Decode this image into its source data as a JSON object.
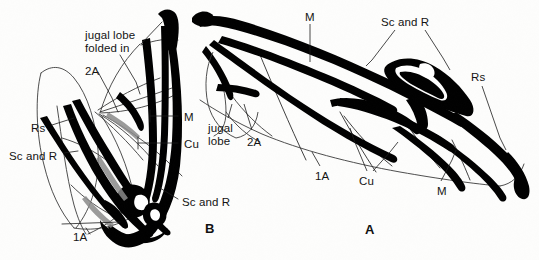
{
  "figure": {
    "background_color": "#fdfdfc",
    "ink_color": "#000000",
    "thin_line_color": "#2a2a2a"
  },
  "panels": [
    {
      "id": "panel-a",
      "letter": "A",
      "x": 365,
      "y": 222,
      "description": "hindwing spread out, jugal lobe expanded"
    },
    {
      "id": "panel-b",
      "letter": "B",
      "x": 205,
      "y": 221,
      "description": "hindwing folded, jugal lobe folded in"
    }
  ],
  "labels": [
    {
      "id": "b-jugal-lobe-folded-in",
      "text": "jugal lobe\nfolded in",
      "x": 85,
      "y": 29,
      "panel": "B",
      "multiline": true
    },
    {
      "id": "b-2a",
      "text": "2A",
      "x": 85,
      "y": 65,
      "panel": "B",
      "multiline": false
    },
    {
      "id": "b-rs",
      "text": "Rs",
      "x": 31,
      "y": 122,
      "panel": "B",
      "multiline": false
    },
    {
      "id": "b-sc-and-r-left",
      "text": "Sc and R",
      "x": 9,
      "y": 150,
      "panel": "B",
      "multiline": false
    },
    {
      "id": "b-m",
      "text": "M",
      "x": 184,
      "y": 111,
      "panel": "B",
      "multiline": false
    },
    {
      "id": "b-cu",
      "text": "Cu",
      "x": 184,
      "y": 138,
      "panel": "B",
      "multiline": false
    },
    {
      "id": "b-sc-and-r-right",
      "text": "Sc and R",
      "x": 182,
      "y": 196,
      "panel": "B",
      "multiline": false
    },
    {
      "id": "b-1a",
      "text": "1A",
      "x": 73,
      "y": 231,
      "panel": "B",
      "multiline": false
    },
    {
      "id": "a-m-top",
      "text": "M",
      "x": 305,
      "y": 11,
      "panel": "A",
      "multiline": false
    },
    {
      "id": "a-sc-and-r",
      "text": "Sc and R",
      "x": 381,
      "y": 16,
      "panel": "A",
      "multiline": false
    },
    {
      "id": "a-rs",
      "text": "Rs",
      "x": 471,
      "y": 71,
      "panel": "A",
      "multiline": false
    },
    {
      "id": "a-jugal-lobe",
      "text": "jugal\nlobe",
      "x": 208,
      "y": 122,
      "panel": "A",
      "multiline": true
    },
    {
      "id": "a-2a",
      "text": "2A",
      "x": 247,
      "y": 136,
      "panel": "A",
      "multiline": false
    },
    {
      "id": "a-1a",
      "text": "1A",
      "x": 315,
      "y": 170,
      "panel": "A",
      "multiline": false
    },
    {
      "id": "a-cu",
      "text": "Cu",
      "x": 359,
      "y": 175,
      "panel": "A",
      "multiline": false
    },
    {
      "id": "a-m-bottom",
      "text": "M",
      "x": 437,
      "y": 185,
      "panel": "A",
      "multiline": false
    }
  ],
  "vein_names": [
    "Sc and R",
    "Rs",
    "M",
    "Cu",
    "1A",
    "2A"
  ],
  "structures": [
    "jugal lobe",
    "jugal lobe folded in"
  ]
}
